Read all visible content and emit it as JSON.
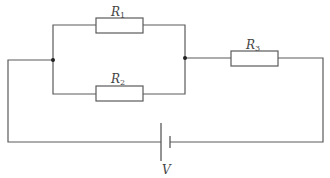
{
  "diagram": {
    "type": "circuit",
    "colors": {
      "wire": "#5a5a5a",
      "component_fill": "#ffffff",
      "label": "#444444"
    },
    "components": [
      {
        "id": "R1",
        "kind": "resistor",
        "label": "R",
        "subscript": "1",
        "branch": "parallel-top"
      },
      {
        "id": "R2",
        "kind": "resistor",
        "label": "R",
        "subscript": "2",
        "branch": "parallel-bottom"
      },
      {
        "id": "R3",
        "kind": "resistor",
        "label": "R",
        "subscript": "3",
        "branch": "series"
      },
      {
        "id": "V",
        "kind": "battery",
        "label": "V"
      }
    ],
    "junctions": [
      "left-parallel-node",
      "right-parallel-node"
    ]
  }
}
